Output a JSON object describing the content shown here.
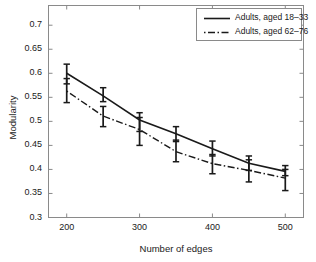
{
  "chart_data": {
    "type": "line",
    "title": "",
    "xlabel": "Number of edges",
    "ylabel": "Modularity",
    "x": [
      200,
      250,
      300,
      350,
      400,
      450,
      500
    ],
    "xlim": [
      175,
      525
    ],
    "ylim": [
      0.3,
      0.741
    ],
    "xticks": [
      200,
      300,
      400,
      500
    ],
    "xtick_labels": [
      "200",
      "300",
      "400",
      "500"
    ],
    "yticks": [
      0.3,
      0.35,
      0.4,
      0.45,
      0.5,
      0.55,
      0.6,
      0.65,
      0.7
    ],
    "ytick_labels": [
      "0.3",
      "0.35",
      "0.4",
      "0.45",
      "0.5",
      "0.55",
      "0.6",
      "0.65",
      "0.7"
    ],
    "grid": false,
    "legend_position": "upper right",
    "series": [
      {
        "name": "Adults, aged 18–33",
        "style": "solid",
        "color": "#1a1a1a",
        "values": [
          0.6,
          0.553,
          0.503,
          0.474,
          0.443,
          0.413,
          0.396
        ],
        "err_low": [
          0.578,
          0.541,
          0.479,
          0.458,
          0.428,
          0.398,
          0.387
        ],
        "err_high": [
          0.619,
          0.57,
          0.518,
          0.489,
          0.459,
          0.428,
          0.408
        ]
      },
      {
        "name": "Adults, aged 62–76",
        "style": "dashdot",
        "color": "#1a1a1a",
        "values": [
          0.563,
          0.511,
          0.483,
          0.437,
          0.412,
          0.398,
          0.382
        ],
        "err_low": [
          0.539,
          0.489,
          0.45,
          0.416,
          0.391,
          0.374,
          0.356
        ],
        "err_high": [
          0.589,
          0.531,
          0.508,
          0.461,
          0.431,
          0.42,
          0.4
        ]
      }
    ]
  },
  "axes": {
    "ylabel": "Modularity",
    "xlabel": "Number of edges"
  },
  "legend": {
    "items": [
      {
        "label": "Adults, aged 18–33"
      },
      {
        "label": "Adults, aged 62–76"
      }
    ]
  }
}
